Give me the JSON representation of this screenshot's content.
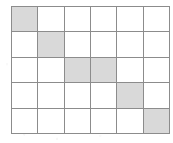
{
  "figure": {
    "colors": {
      "shaded_fill": "#d9d9d9",
      "empty_fill": "#ffffff",
      "grid_line": "#8c8c8c",
      "background": "#ffffff"
    }
  },
  "chart_data": {
    "type": "heatmap",
    "title": "",
    "subtitle": "",
    "xlabel": "",
    "ylabel": "",
    "columns": 6,
    "rows": 5,
    "column_labels": [
      "1",
      "2",
      "3",
      "4",
      "5",
      "6"
    ],
    "row_labels": [
      "1",
      "2",
      "3",
      "4",
      "5"
    ],
    "grid": true,
    "legend": "none",
    "value_meaning": {
      "0": "unshaded (white)",
      "1": "shaded (light gray)"
    },
    "values": [
      [
        1,
        0,
        0,
        0,
        0,
        0
      ],
      [
        0,
        1,
        0,
        0,
        0,
        0
      ],
      [
        0,
        0,
        1,
        1,
        0,
        0
      ],
      [
        0,
        0,
        0,
        0,
        1,
        0
      ],
      [
        0,
        0,
        0,
        0,
        0,
        1
      ]
    ],
    "shaded_cells": [
      {
        "row": 1,
        "column": 1
      },
      {
        "row": 2,
        "column": 2
      },
      {
        "row": 3,
        "column": 3
      },
      {
        "row": 3,
        "column": 4
      },
      {
        "row": 4,
        "column": 5
      },
      {
        "row": 5,
        "column": 6
      }
    ],
    "shaded_count": 6,
    "total_cells": 30
  }
}
